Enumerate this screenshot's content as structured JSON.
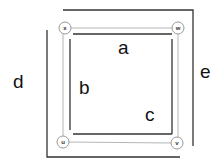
{
  "diagram": {
    "nodes": [
      {
        "id": "x",
        "label": "x"
      },
      {
        "id": "w",
        "label": "w"
      },
      {
        "id": "u",
        "label": "u"
      },
      {
        "id": "v",
        "label": "v"
      }
    ],
    "labels": {
      "a": "a",
      "b": "b",
      "c": "c",
      "d": "d",
      "e": "e"
    },
    "colors": {
      "dark_line": "#333333",
      "light_line": "#b0b0b0",
      "node_stroke": "#999999"
    }
  }
}
